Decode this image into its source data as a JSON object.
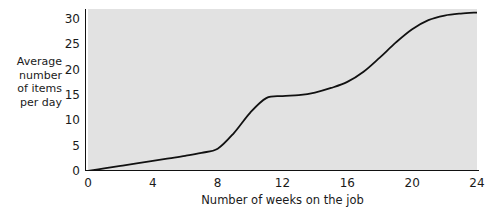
{
  "chart_data": {
    "type": "line",
    "title": "",
    "xlabel": "Number of weeks on the job",
    "ylabel": "Average number of items per day",
    "ylabel_lines": [
      "Average",
      "number",
      "of items",
      "per day"
    ],
    "xlim": [
      0,
      24
    ],
    "ylim": [
      0,
      32
    ],
    "xticks": [
      0,
      4,
      8,
      12,
      16,
      20,
      24
    ],
    "yticks": [
      0,
      5,
      10,
      15,
      20,
      25,
      30
    ],
    "xtick_labels": [
      "0",
      "4",
      "8",
      "12",
      "16",
      "20",
      "24"
    ],
    "ytick_labels": [
      "0",
      "5",
      "10",
      "15",
      "20",
      "25",
      "30"
    ],
    "grid": false,
    "legend": "none",
    "plot_background": "#e2e2e2",
    "line_color": "#111111",
    "line_width": 1.8,
    "series": [
      {
        "name": "Average number of items per day",
        "x": [
          0,
          1,
          2,
          3,
          4,
          5,
          6,
          7,
          8,
          9,
          10,
          11,
          12,
          13,
          14,
          15,
          16,
          17,
          18,
          19,
          20,
          21,
          22,
          23,
          24
        ],
        "values": [
          0,
          0.5,
          1.0,
          1.5,
          2.0,
          2.5,
          3.0,
          3.6,
          4.4,
          7.5,
          11.5,
          14.4,
          14.8,
          15.0,
          15.5,
          16.4,
          17.6,
          19.6,
          22.4,
          25.4,
          28.0,
          29.8,
          30.7,
          31.1,
          31.3
        ]
      }
    ],
    "annotations": []
  }
}
